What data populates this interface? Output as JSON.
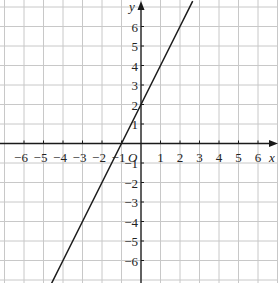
{
  "chart_data": {
    "type": "line",
    "title": "",
    "xlabel": "x",
    "ylabel": "y",
    "origin_label": "O",
    "xlim": [
      -7.2,
      7.0
    ],
    "ylim": [
      -7.2,
      7.3
    ],
    "grid": true,
    "x_ticks": [
      -6,
      -5,
      -4,
      -3,
      -2,
      -1,
      1,
      2,
      3,
      4,
      5,
      6
    ],
    "y_ticks": [
      -6,
      -5,
      -4,
      -3,
      -2,
      -1,
      1,
      2,
      3,
      4,
      5,
      6
    ],
    "x_tick_labels": [
      "−6",
      "−5",
      "−4",
      "−3",
      "−2",
      "−1",
      "1",
      "2",
      "3",
      "4",
      "5",
      "6"
    ],
    "y_tick_labels": [
      "−6",
      "−5",
      "−4",
      "−3",
      "−2",
      "−1",
      "1",
      "2",
      "3",
      "4",
      "5",
      "6"
    ],
    "series": [
      {
        "name": "y = 2x + 2",
        "equation": {
          "slope": 2,
          "intercept": 2
        },
        "x": [
          -4.6,
          -4,
          -3,
          -2,
          -1,
          0,
          1,
          2,
          2.65
        ],
        "y": [
          -7.2,
          -6,
          -4,
          -2,
          0,
          2,
          4,
          6,
          7.3
        ],
        "color": "#1a1a1a"
      }
    ],
    "legend": null
  },
  "colors": {
    "grid": "#c8c8c8",
    "axis": "#1a1a1a",
    "line": "#1a1a1a",
    "background": "#ffffff"
  }
}
